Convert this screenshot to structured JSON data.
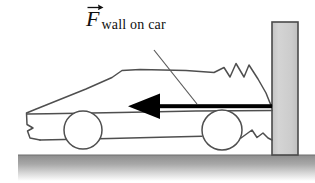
{
  "figure": {
    "background_color": "#ffffff",
    "width": 315,
    "height": 183
  },
  "label": {
    "symbol": "F",
    "vector_arrow": "vector-overbar-arrow",
    "subscript": "wall on car",
    "full_text": "F wall on car",
    "color": "#101010"
  },
  "force_arrow": {
    "name": "force-vector-arrow",
    "direction": "left",
    "color": "#000000",
    "tail_x": 272,
    "tip_x": 128,
    "y": 106,
    "shaft_thickness": 4,
    "head_length": 30,
    "head_half_height": 13
  },
  "leader_line": {
    "name": "label-leader-line",
    "from_x": 154,
    "from_y": 50,
    "to_x": 196,
    "to_y": 104,
    "color": "#5a5a5a"
  },
  "wall": {
    "name": "wall",
    "fill_color": "#cfcfcf",
    "stroke_color": "#4a4a4a",
    "x": 272,
    "y": 22,
    "width": 26,
    "height": 133
  },
  "ground": {
    "name": "ground-surface",
    "top_color": "#8d8d8d",
    "bottom_color": "#ffffff",
    "y": 155,
    "height": 28,
    "line_color": "#6f6f6f"
  },
  "car": {
    "name": "car-body",
    "stroke_color": "#4f4f4f",
    "fill_color": "#ffffff",
    "crumple_zone": "front-end-crumpled",
    "body_outline": "M 39,139 L 29,137 L 28,129 L 33,127 L 28,124 L 27,112 L 34,109 L 84,89 L 110,78 L 120,70 L 138,69 L 195,70 L 219,72 L 228,67 L 236,78 L 242,63 L 252,76 L 256,66 L 264,79 L 269,93 L 272,104",
    "sill_line": "M 272,109 L 200,110 L 120,112 L 40,114 L 29,114",
    "underbody_line": "M 40,139 L 130,137 L 196,135",
    "front_crumple": "M 240,139 L 252,131 L 258,138 L 264,134 L 272,140",
    "rear_detail": "M 28,129 L 33,127 L 28,124"
  },
  "wheels": [
    {
      "name": "rear-wheel",
      "cx": 83,
      "cy": 130,
      "r": 19,
      "stroke_color": "#4f4f4f",
      "fill_color": "#ffffff"
    },
    {
      "name": "front-wheel",
      "cx": 222,
      "cy": 130,
      "r": 20,
      "stroke_color": "#4f4f4f",
      "fill_color": "#ffffff"
    }
  ]
}
